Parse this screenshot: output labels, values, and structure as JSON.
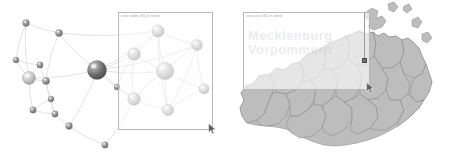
{
  "view": {
    "width": 452,
    "height": 165,
    "background": "#ffffff",
    "panel_count": 2
  },
  "colors": {
    "page_background": "#ffffff",
    "node_fill_dark": "#6b6b6b",
    "node_fill_mid": "#8f8f8f",
    "node_fill_light": "#c9c9c9",
    "node_highlight": "#f2f2f2",
    "edge_stroke": "#cfcfcf",
    "selection_border": "#b9b9b9",
    "map_region_fill": "#bdbdbd",
    "map_region_stroke": "#8a8a8a",
    "map_outer_stroke": "#707070",
    "marker_fill": "#6e6e6e",
    "caption_text": "#9b9b9b",
    "watermark_text": "#bebebe"
  },
  "graph_panel": {
    "name": "network-graph-panel",
    "selection": {
      "caption": "sono nodes (65) in select",
      "x": 118,
      "y": 12,
      "width": 95,
      "height": 118
    },
    "cursor": {
      "shape": "arrow-pointer",
      "x": 208,
      "y": 123
    },
    "node_count": 20,
    "edge_count": 44
  },
  "map_panel": {
    "name": "region-map-panel",
    "region_title": "Mecklenburg-Vorpommern",
    "selection": {
      "caption": "sono area (65) in select",
      "x": 17,
      "y": 12,
      "width": 127,
      "height": 78
    },
    "watermark": "Mecklenburg\nVorpommern",
    "marker": {
      "label": "selected-location",
      "x": 136,
      "y": 58
    },
    "cursor": {
      "shape": "arrow-pointer",
      "x": 140,
      "y": 82
    },
    "district_count": 14
  },
  "chart_data": {
    "type": "scatter",
    "title": "",
    "xlabel": "",
    "ylabel": "",
    "xlim": [
      0,
      226
    ],
    "ylim": [
      0,
      165
    ],
    "grid": false,
    "legend": "none",
    "nodes": [
      {
        "id": "n1",
        "x": 26,
        "y": 23,
        "r": 3.4,
        "tone": "mid"
      },
      {
        "id": "n2",
        "x": 59,
        "y": 33,
        "r": 3.6,
        "tone": "mid"
      },
      {
        "id": "n3",
        "x": 16,
        "y": 60,
        "r": 3.0,
        "tone": "mid"
      },
      {
        "id": "n4",
        "x": 40,
        "y": 65,
        "r": 3.2,
        "tone": "mid"
      },
      {
        "id": "n5",
        "x": 29,
        "y": 78,
        "r": 6.4,
        "tone": "light"
      },
      {
        "id": "n6",
        "x": 46,
        "y": 81,
        "r": 3.6,
        "tone": "mid"
      },
      {
        "id": "n7",
        "x": 51,
        "y": 99,
        "r": 3.0,
        "tone": "mid"
      },
      {
        "id": "n8",
        "x": 33,
        "y": 110,
        "r": 3.2,
        "tone": "mid"
      },
      {
        "id": "n9",
        "x": 55,
        "y": 114,
        "r": 3.2,
        "tone": "mid"
      },
      {
        "id": "n10",
        "x": 69,
        "y": 126,
        "r": 3.4,
        "tone": "mid"
      },
      {
        "id": "n11",
        "x": 105,
        "y": 145,
        "r": 3.2,
        "tone": "mid"
      },
      {
        "id": "n12",
        "x": 97,
        "y": 70,
        "r": 9.6,
        "tone": "dark"
      },
      {
        "id": "n13",
        "x": 134,
        "y": 54,
        "r": 6.2,
        "tone": "light"
      },
      {
        "id": "n14",
        "x": 158,
        "y": 31,
        "r": 6.0,
        "tone": "light"
      },
      {
        "id": "n15",
        "x": 197,
        "y": 45,
        "r": 5.4,
        "tone": "light"
      },
      {
        "id": "n16",
        "x": 165,
        "y": 71,
        "r": 8.6,
        "tone": "light"
      },
      {
        "id": "n17",
        "x": 204,
        "y": 89,
        "r": 5.0,
        "tone": "light"
      },
      {
        "id": "n18",
        "x": 134,
        "y": 99,
        "r": 6.2,
        "tone": "light"
      },
      {
        "id": "n19",
        "x": 168,
        "y": 110,
        "r": 5.6,
        "tone": "light"
      },
      {
        "id": "n20",
        "x": 117,
        "y": 87,
        "r": 3.0,
        "tone": "mid"
      }
    ],
    "edges": [
      [
        "n1",
        "n2"
      ],
      [
        "n1",
        "n3"
      ],
      [
        "n1",
        "n5"
      ],
      [
        "n2",
        "n6"
      ],
      [
        "n2",
        "n12"
      ],
      [
        "n3",
        "n4"
      ],
      [
        "n3",
        "n5"
      ],
      [
        "n4",
        "n5"
      ],
      [
        "n4",
        "n6"
      ],
      [
        "n5",
        "n6"
      ],
      [
        "n5",
        "n8"
      ],
      [
        "n6",
        "n7"
      ],
      [
        "n6",
        "n9"
      ],
      [
        "n7",
        "n9"
      ],
      [
        "n7",
        "n8"
      ],
      [
        "n8",
        "n9"
      ],
      [
        "n9",
        "n10"
      ],
      [
        "n10",
        "n11"
      ],
      [
        "n10",
        "n12"
      ],
      [
        "n5",
        "n12"
      ],
      [
        "n2",
        "n14"
      ],
      [
        "n12",
        "n13"
      ],
      [
        "n12",
        "n14"
      ],
      [
        "n12",
        "n16"
      ],
      [
        "n12",
        "n18"
      ],
      [
        "n12",
        "n15"
      ],
      [
        "n13",
        "n14"
      ],
      [
        "n13",
        "n16"
      ],
      [
        "n13",
        "n18"
      ],
      [
        "n13",
        "n20"
      ],
      [
        "n14",
        "n15"
      ],
      [
        "n14",
        "n16"
      ],
      [
        "n14",
        "n19"
      ],
      [
        "n15",
        "n16"
      ],
      [
        "n15",
        "n17"
      ],
      [
        "n16",
        "n17"
      ],
      [
        "n16",
        "n18"
      ],
      [
        "n16",
        "n19"
      ],
      [
        "n17",
        "n19"
      ],
      [
        "n18",
        "n19"
      ],
      [
        "n18",
        "n20"
      ],
      [
        "n19",
        "n15"
      ],
      [
        "n11",
        "n18"
      ],
      [
        "n20",
        "n12"
      ]
    ]
  }
}
